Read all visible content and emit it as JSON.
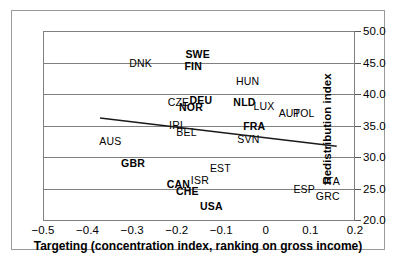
{
  "chart_data": {
    "type": "scatter",
    "title": "",
    "xlabel": "Targeting (concentration index, ranking on gross income)",
    "ylabel": "Redistribution index",
    "xlim": [
      -0.5,
      0.2
    ],
    "ylim": [
      20.0,
      50.0
    ],
    "xticks": [
      "−0.5",
      "−0.4",
      "−0.3",
      "−0.2",
      "−0.1",
      "0",
      "0.1",
      "0.2"
    ],
    "xtick_values": [
      -0.5,
      -0.4,
      -0.3,
      -0.2,
      -0.1,
      0,
      0.1,
      0.2
    ],
    "yticks": [
      "20.0",
      "25.0",
      "30.0",
      "35.0",
      "40.0",
      "45.0",
      "50.0"
    ],
    "ytick_values": [
      20.0,
      25.0,
      30.0,
      35.0,
      40.0,
      45.0,
      50.0
    ],
    "grid": "horizontal",
    "legend": "none",
    "y_axis_position": "right",
    "points": [
      {
        "label": "SWE",
        "x": -0.153,
        "y": 46.3,
        "bold": true
      },
      {
        "label": "DNK",
        "x": -0.281,
        "y": 44.9,
        "bold": false
      },
      {
        "label": "FIN",
        "x": -0.163,
        "y": 44.5,
        "bold": true
      },
      {
        "label": "HUN",
        "x": -0.041,
        "y": 42.0,
        "bold": false
      },
      {
        "label": "CZE",
        "x": -0.196,
        "y": 38.8,
        "bold": false
      },
      {
        "label": "DEU",
        "x": -0.146,
        "y": 39.0,
        "bold": true
      },
      {
        "label": "NLD",
        "x": -0.048,
        "y": 38.8,
        "bold": true
      },
      {
        "label": "NOR",
        "x": -0.168,
        "y": 38.0,
        "bold": true
      },
      {
        "label": "LUX",
        "x": -0.004,
        "y": 38.1,
        "bold": false
      },
      {
        "label": "AUT",
        "x": 0.053,
        "y": 37.0,
        "bold": false
      },
      {
        "label": "POL",
        "x": 0.085,
        "y": 37.0,
        "bold": false
      },
      {
        "label": "IRL",
        "x": -0.198,
        "y": 35.1,
        "bold": false
      },
      {
        "label": "FRA",
        "x": -0.026,
        "y": 35.0,
        "bold": true
      },
      {
        "label": "BEL",
        "x": -0.178,
        "y": 34.0,
        "bold": false
      },
      {
        "label": "SVN",
        "x": -0.039,
        "y": 32.8,
        "bold": false
      },
      {
        "label": "AUS",
        "x": -0.349,
        "y": 32.6,
        "bold": false
      },
      {
        "label": "GBR",
        "x": -0.298,
        "y": 29.0,
        "bold": true
      },
      {
        "label": "EST",
        "x": -0.102,
        "y": 28.2,
        "bold": false
      },
      {
        "label": "ISR",
        "x": -0.148,
        "y": 26.4,
        "bold": false
      },
      {
        "label": "ITA",
        "x": 0.148,
        "y": 26.2,
        "bold": false
      },
      {
        "label": "CAN",
        "x": -0.196,
        "y": 25.7,
        "bold": true
      },
      {
        "label": "ESP",
        "x": 0.086,
        "y": 25.0,
        "bold": false
      },
      {
        "label": "CHE",
        "x": -0.176,
        "y": 24.6,
        "bold": true
      },
      {
        "label": "GRC",
        "x": 0.139,
        "y": 23.8,
        "bold": false
      },
      {
        "label": "USA",
        "x": -0.122,
        "y": 22.2,
        "bold": true
      }
    ],
    "trendline": {
      "x_start": -0.372,
      "y_start": 36.2,
      "x_end": 0.159,
      "y_end": 31.7,
      "style": "solid",
      "color": "#1a1a1a"
    }
  }
}
